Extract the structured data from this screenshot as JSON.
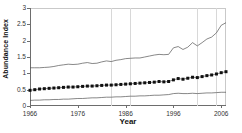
{
  "chart_data": {
    "type": "line",
    "title": "",
    "xlabel": "Year",
    "ylabel": "Abundance Index",
    "xlim": [
      1966,
      2007
    ],
    "ylim": [
      0,
      3
    ],
    "yticks": [
      0,
      0.5,
      1,
      1.5,
      2,
      2.5,
      3
    ],
    "ytick_labels": [
      "0",
      "0.5",
      "1",
      "1.5",
      "2",
      "2.5",
      "3"
    ],
    "xticks": [
      1966,
      1976,
      1986,
      1996,
      2006
    ],
    "xtick_labels": [
      "1966",
      "1976",
      "1986",
      "1996",
      "2006"
    ],
    "grid": "vertical-only",
    "gridlines_x": [
      1983,
      1987,
      2001,
      2005
    ],
    "legend": "none",
    "x": [
      1966,
      1967,
      1968,
      1969,
      1970,
      1971,
      1972,
      1973,
      1974,
      1975,
      1976,
      1977,
      1978,
      1979,
      1980,
      1981,
      1982,
      1983,
      1984,
      1985,
      1986,
      1987,
      1988,
      1989,
      1990,
      1991,
      1992,
      1993,
      1994,
      1995,
      1996,
      1997,
      1998,
      1999,
      2000,
      2001,
      2002,
      2003,
      2004,
      2005,
      2006,
      2007
    ],
    "series": [
      {
        "name": "upper-confidence-bound",
        "style": "line",
        "values": [
          1.17,
          1.17,
          1.17,
          1.18,
          1.19,
          1.21,
          1.24,
          1.26,
          1.28,
          1.27,
          1.28,
          1.31,
          1.33,
          1.3,
          1.31,
          1.35,
          1.38,
          1.36,
          1.4,
          1.42,
          1.45,
          1.46,
          1.47,
          1.47,
          1.5,
          1.53,
          1.56,
          1.58,
          1.57,
          1.58,
          1.78,
          1.82,
          1.73,
          1.8,
          1.94,
          1.84,
          1.94,
          2.05,
          2.11,
          2.24,
          2.47,
          2.55
        ]
      },
      {
        "name": "abundance-index-point-estimate",
        "style": "line-with-square-markers",
        "values": [
          0.48,
          0.5,
          0.52,
          0.53,
          0.54,
          0.55,
          0.56,
          0.57,
          0.58,
          0.58,
          0.59,
          0.6,
          0.61,
          0.61,
          0.62,
          0.63,
          0.64,
          0.64,
          0.65,
          0.66,
          0.67,
          0.68,
          0.69,
          0.7,
          0.71,
          0.72,
          0.73,
          0.75,
          0.74,
          0.75,
          0.8,
          0.84,
          0.82,
          0.85,
          0.88,
          0.87,
          0.9,
          0.93,
          0.95,
          0.98,
          1.02,
          1.05
        ]
      },
      {
        "name": "lower-confidence-bound",
        "style": "line",
        "values": [
          0.17,
          0.18,
          0.18,
          0.19,
          0.19,
          0.2,
          0.2,
          0.21,
          0.21,
          0.22,
          0.23,
          0.23,
          0.24,
          0.25,
          0.25,
          0.26,
          0.27,
          0.27,
          0.28,
          0.28,
          0.29,
          0.3,
          0.3,
          0.31,
          0.31,
          0.32,
          0.33,
          0.33,
          0.34,
          0.35,
          0.38,
          0.39,
          0.38,
          0.38,
          0.39,
          0.38,
          0.39,
          0.4,
          0.4,
          0.41,
          0.42,
          0.42
        ]
      }
    ]
  }
}
